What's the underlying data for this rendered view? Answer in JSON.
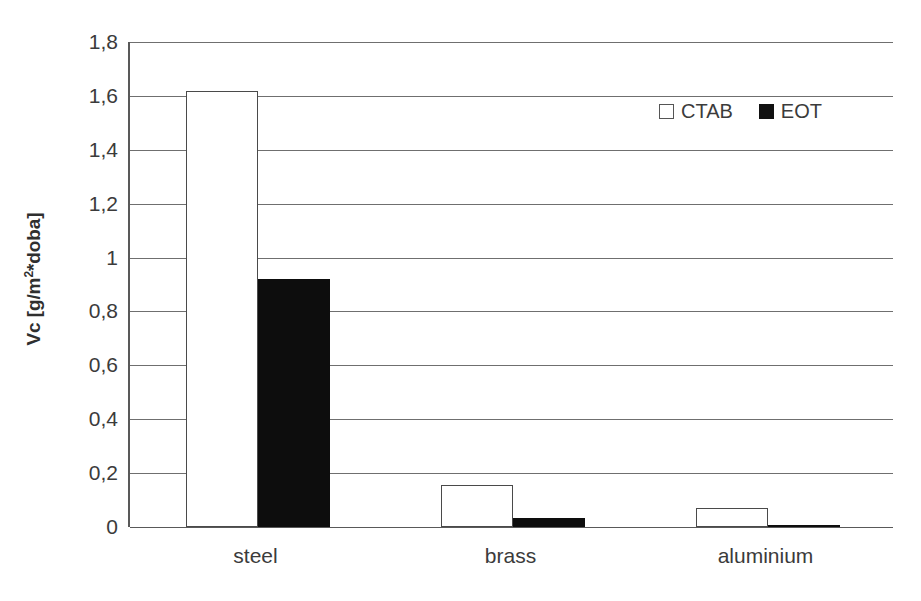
{
  "chart_data": {
    "type": "bar",
    "title": "",
    "xlabel": "",
    "ylabel": "Vc [g/m2*doba]",
    "ylabel_prefix": "Vc [g/m",
    "ylabel_sup": "2",
    "ylabel_suffix": "*doba]",
    "categories": [
      "steel",
      "brass",
      "aluminium"
    ],
    "series": [
      {
        "name": "CTAB",
        "values": [
          1.62,
          0.155,
          0.07
        ],
        "color": "#ffffff",
        "swatch": "open"
      },
      {
        "name": "EOT",
        "values": [
          0.92,
          0.035,
          0.005
        ],
        "color": "#0d0d0d",
        "swatch": "filled"
      }
    ],
    "ylim": [
      0,
      1.8
    ],
    "ytick_values": [
      0,
      0.2,
      0.4,
      0.6,
      0.8,
      1,
      1.2,
      1.4,
      1.6,
      1.8
    ],
    "ytick_labels": [
      "0",
      "0,2",
      "0,4",
      "0,6",
      "0,8",
      "1",
      "1,2",
      "1,4",
      "1,6",
      "1,8"
    ],
    "grid": true,
    "legend_position": "top-right",
    "decimal_separator": ","
  },
  "legend": {
    "entries": [
      {
        "label": "CTAB"
      },
      {
        "label": "EOT"
      }
    ]
  },
  "colors": {
    "axis": "#595959",
    "gridline": "#6f6f6f",
    "text": "#3b3b3b",
    "bar_ctab": "#ffffff",
    "bar_eot": "#0d0d0d",
    "background": "#ffffff"
  }
}
